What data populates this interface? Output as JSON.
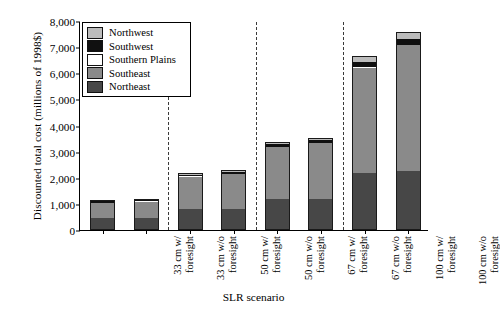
{
  "chart_data": {
    "type": "bar",
    "subtype": "stacked",
    "title": "",
    "xlabel": "SLR scenario",
    "ylabel": "Discounted total cost (millions of 1998$)",
    "ylim": [
      0,
      8000
    ],
    "ytick_labels": [
      "0",
      "1,000",
      "2,000",
      "3,000",
      "4,000",
      "5,000",
      "6,000",
      "7,000",
      "8,000"
    ],
    "ytick_values": [
      0,
      1000,
      2000,
      3000,
      4000,
      5000,
      6000,
      7000,
      8000
    ],
    "grid": false,
    "legend_position": "upper-left-inside",
    "categories": [
      "33 cm w/ foresight",
      "33 cm w/o foresight",
      "50 cm w/ foresight",
      "50 cm w/o foresight",
      "67 cm w/ foresight",
      "67 cm w/o foresight",
      "100 cm w/ foresight",
      "100 cm w/o foresight"
    ],
    "category_lines": [
      [
        "33 cm w/",
        "foresight"
      ],
      [
        "33 cm w/o",
        "foresight"
      ],
      [
        "50 cm w/",
        "foresight"
      ],
      [
        "50 cm w/o",
        "foresight"
      ],
      [
        "67 cm w/",
        "foresight"
      ],
      [
        "67 cm w/o",
        "foresight"
      ],
      [
        "100 cm w/",
        "foresight"
      ],
      [
        "100 cm w/o",
        "foresight"
      ]
    ],
    "group_separators_after": [
      1,
      3,
      5
    ],
    "stack_order_bottom_to_top": [
      "Northeast",
      "Southeast",
      "Southern Plains",
      "Southwest",
      "Northwest"
    ],
    "series": [
      {
        "name": "Northeast",
        "color": "#474747",
        "values": [
          460,
          460,
          800,
          800,
          1200,
          1180,
          2200,
          2270
        ]
      },
      {
        "name": "Southeast",
        "color": "#8a8a8a",
        "values": [
          570,
          620,
          1230,
          1330,
          1970,
          2140,
          4000,
          4800
        ]
      },
      {
        "name": "Southern Plains",
        "color": "#ffffff",
        "values": [
          15,
          15,
          20,
          20,
          25,
          25,
          30,
          30
        ]
      },
      {
        "name": "Southwest",
        "color": "#101010",
        "values": [
          60,
          70,
          70,
          80,
          110,
          110,
          200,
          210
        ]
      },
      {
        "name": "Northwest",
        "color": "#bcbcbc",
        "values": [
          20,
          20,
          50,
          50,
          70,
          70,
          250,
          260
        ]
      }
    ],
    "totals": [
      1125,
      1185,
      2170,
      2280,
      3375,
      3525,
      6680,
      7570
    ]
  },
  "legend": {
    "entries": [
      {
        "label": "Northwest",
        "color": "#bcbcbc"
      },
      {
        "label": "Southwest",
        "color": "#101010"
      },
      {
        "label": "Southern Plains",
        "color": "#ffffff"
      },
      {
        "label": "Southeast",
        "color": "#8a8a8a"
      },
      {
        "label": "Northeast",
        "color": "#474747"
      }
    ]
  }
}
